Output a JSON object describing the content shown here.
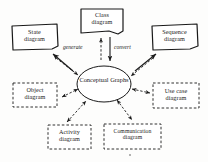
{
  "figure": {
    "background_color": "#fdfdfc",
    "stroke_color": "#1a1a1a"
  },
  "center": {
    "name": "conceptual-graphs",
    "line1": "Conceptual",
    "line2": "Graphs",
    "shape": "ellipse"
  },
  "nodes": [
    {
      "id": "class-diagram",
      "line1": "Class",
      "line2": "diagram",
      "border": "solid",
      "shape": "document-note",
      "position": "top-center"
    },
    {
      "id": "state-diagram",
      "line1": "State",
      "line2": "diagram",
      "border": "solid",
      "shape": "document-note",
      "position": "top-left"
    },
    {
      "id": "sequence-diagram",
      "line1": "Sequence",
      "line2": "diagram",
      "border": "solid",
      "shape": "document-note",
      "position": "top-right"
    },
    {
      "id": "object-diagram",
      "line1": "Object",
      "line2": "diagram",
      "border": "dashed",
      "shape": "rectangle",
      "position": "mid-left"
    },
    {
      "id": "use-case-diagram",
      "line1": "Use case",
      "line2": "diagram",
      "border": "dashed",
      "shape": "rectangle",
      "position": "mid-right"
    },
    {
      "id": "activity-diagram",
      "line1": "Activity",
      "line2": "diagram",
      "border": "dashed",
      "shape": "rectangle",
      "position": "bottom-left"
    },
    {
      "id": "communication-diagram",
      "line1": "Communication",
      "line2": "diagram",
      "border": "dashed",
      "shape": "rectangle",
      "position": "bottom-right"
    }
  ],
  "edge_labels": {
    "generate": "generate",
    "convert": "convert"
  }
}
